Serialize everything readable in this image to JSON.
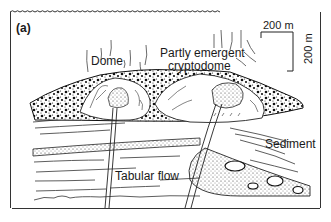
{
  "figure": {
    "panel_label": "(a)",
    "labels": {
      "dome": "Dome",
      "cryptodome_line1": "Partly emergent",
      "cryptodome_line2": "cryptodome",
      "sediment": "Sediment",
      "tabular_flow": "Tabular flow"
    },
    "scale_bar": {
      "horizontal": "200 m",
      "vertical": "200 m"
    },
    "colors": {
      "ink": "#1a1a1a",
      "background": "#ffffff",
      "stipple": "#555555"
    }
  }
}
